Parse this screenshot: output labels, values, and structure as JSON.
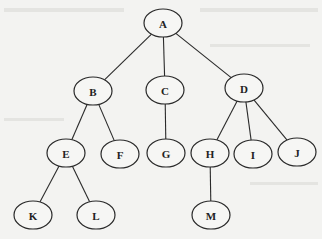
{
  "diagram": {
    "type": "tree",
    "root": "A",
    "node_rx": 19,
    "node_ry": 14,
    "colors": {
      "background": "#f3f3f1",
      "stroke": "#2a2a2a",
      "node_fill": "#f6f6f4",
      "text": "#222222"
    },
    "nodes": [
      {
        "id": "A",
        "label": "A",
        "x": 163,
        "y": 23
      },
      {
        "id": "B",
        "label": "B",
        "x": 93,
        "y": 91
      },
      {
        "id": "C",
        "label": "C",
        "x": 165,
        "y": 90
      },
      {
        "id": "D",
        "label": "D",
        "x": 244,
        "y": 88
      },
      {
        "id": "E",
        "label": "E",
        "x": 66,
        "y": 153
      },
      {
        "id": "F",
        "label": "F",
        "x": 120,
        "y": 154
      },
      {
        "id": "G",
        "label": "G",
        "x": 166,
        "y": 153
      },
      {
        "id": "H",
        "label": "H",
        "x": 210,
        "y": 153
      },
      {
        "id": "I",
        "label": "I",
        "x": 253,
        "y": 154
      },
      {
        "id": "J",
        "label": "J",
        "x": 297,
        "y": 152
      },
      {
        "id": "K",
        "label": "K",
        "x": 33,
        "y": 215
      },
      {
        "id": "L",
        "label": "L",
        "x": 96,
        "y": 215
      },
      {
        "id": "M",
        "label": "M",
        "x": 211,
        "y": 215
      }
    ],
    "edges": [
      {
        "from": "A",
        "to": "B"
      },
      {
        "from": "A",
        "to": "C"
      },
      {
        "from": "A",
        "to": "D"
      },
      {
        "from": "B",
        "to": "E"
      },
      {
        "from": "B",
        "to": "F"
      },
      {
        "from": "C",
        "to": "G"
      },
      {
        "from": "D",
        "to": "H"
      },
      {
        "from": "D",
        "to": "I"
      },
      {
        "from": "D",
        "to": "J"
      },
      {
        "from": "E",
        "to": "K"
      },
      {
        "from": "E",
        "to": "L"
      },
      {
        "from": "H",
        "to": "M"
      }
    ]
  }
}
